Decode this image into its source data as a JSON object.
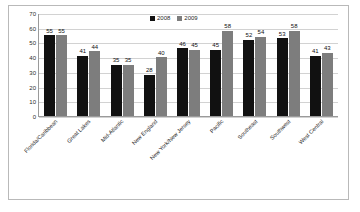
{
  "chart_data": {
    "type": "bar",
    "title": "",
    "xlabel": "",
    "ylabel": "",
    "ylim": [
      0,
      70
    ],
    "yticks": [
      0,
      10,
      20,
      30,
      40,
      50,
      60,
      70
    ],
    "grid": true,
    "legend_position": "top-center",
    "categories": [
      "Florida/Caribbean",
      "Great Lakes",
      "Mid-Atlantic",
      "New England",
      "New York/New Jersey",
      "Pacific",
      "Southeast",
      "Southwest",
      "West Central"
    ],
    "series": [
      {
        "name": "2008",
        "color": "#111111",
        "values": [
          55,
          41,
          35,
          28,
          46,
          45,
          52,
          53,
          41
        ]
      },
      {
        "name": "2009",
        "color": "#7d7d7d",
        "values": [
          55,
          44,
          35,
          40,
          45,
          58,
          54,
          58,
          43
        ]
      }
    ]
  },
  "legend": {
    "items": [
      {
        "label": "2008",
        "color": "#111111"
      },
      {
        "label": "2009",
        "color": "#7d7d7d"
      }
    ]
  }
}
